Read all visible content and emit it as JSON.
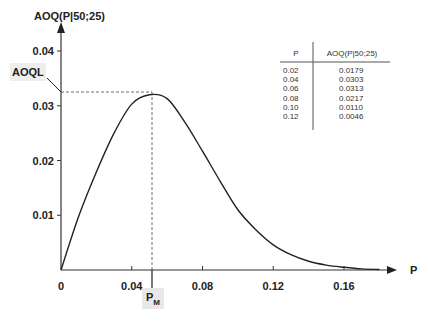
{
  "chart_data": {
    "type": "line",
    "title": "",
    "xlabel": "P",
    "ylabel": "AOQ(P|50;25)",
    "xlim": [
      0,
      0.18
    ],
    "ylim": [
      0,
      0.04
    ],
    "grid": false,
    "x_ticks": [
      "0",
      "0.04",
      "0.08",
      "0.12",
      "0.16"
    ],
    "y_ticks": [
      "0.01",
      "0.02",
      "0.03",
      "0.04"
    ],
    "series": [
      {
        "name": "AOQ(P|50;25)",
        "x": [
          0,
          0.01,
          0.02,
          0.03,
          0.04,
          0.05,
          0.06,
          0.07,
          0.08,
          0.09,
          0.1,
          0.11,
          0.12,
          0.13,
          0.14,
          0.15,
          0.16,
          0.17,
          0.18
        ],
        "values": [
          0,
          0.0098,
          0.0179,
          0.025,
          0.0303,
          0.032,
          0.0313,
          0.027,
          0.0217,
          0.0162,
          0.011,
          0.0074,
          0.0046,
          0.0028,
          0.0016,
          0.0009,
          0.0005,
          0.0002,
          0.0001
        ]
      }
    ],
    "annotations": [
      {
        "label": "AOQL",
        "y": 0.032,
        "note": "dashed horizontal line from y-axis to curve maximum"
      },
      {
        "label": "P_M",
        "x": 0.052,
        "note": "dashed vertical line from curve maximum down to x-axis"
      }
    ],
    "table": {
      "columns": [
        "P",
        "AOQ(P|50;25)"
      ],
      "rows": [
        [
          "0.02",
          "0.0179"
        ],
        [
          "0.04",
          "0.0303"
        ],
        [
          "0.06",
          "0.0313"
        ],
        [
          "0.08",
          "0.0217"
        ],
        [
          "0.10",
          "0.0110"
        ],
        [
          "0.12",
          "0.0046"
        ]
      ]
    }
  },
  "labels": {
    "y_axis_title": "AOQ(P|50;25)",
    "x_axis_title": "P",
    "aoql": "AOQL",
    "pm_main": "P",
    "pm_sub": "M",
    "x0": "0"
  }
}
